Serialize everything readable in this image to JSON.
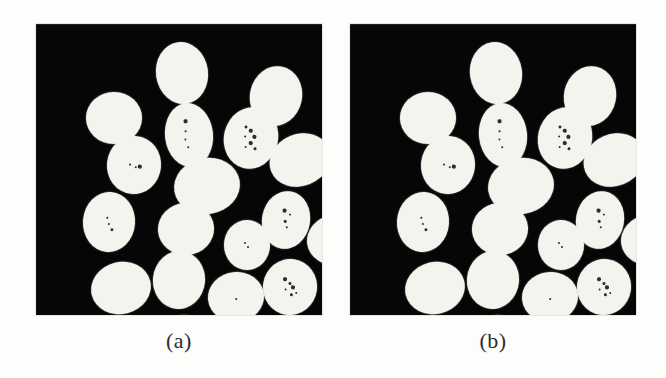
{
  "figure": {
    "width": 666,
    "height": 378,
    "background_color": "#fdfdfc",
    "panel_background_color": "#060606",
    "object_color": "#f4f4ef",
    "speck_color": "#1b1b18",
    "caption_color": "#2c2c2c"
  },
  "panels": [
    {
      "id": "panel-a",
      "caption": "(a)",
      "frame": {
        "x": 36,
        "y": 24,
        "width": 286,
        "height": 291
      },
      "caption_y": 330,
      "object_count": 17,
      "objects": [
        {
          "cx": 146,
          "cy": 49,
          "rx": 26,
          "ry": 31,
          "rot": -8,
          "specks": []
        },
        {
          "cx": 240,
          "cy": 72,
          "rx": 26,
          "ry": 30,
          "rot": 12,
          "specks": []
        },
        {
          "cx": 78,
          "cy": 94,
          "rx": 28,
          "ry": 26,
          "rot": 0,
          "specks": []
        },
        {
          "cx": 153,
          "cy": 111,
          "rx": 24,
          "ry": 32,
          "rot": -6,
          "specks": [
            {
              "x": -2,
              "y": -14,
              "r": 1.6
            },
            {
              "x": -3,
              "y": -4,
              "r": 1.0
            },
            {
              "x": -4,
              "y": 4,
              "r": 1.0
            },
            {
              "x": -2,
              "y": 12,
              "r": 1.3
            }
          ]
        },
        {
          "cx": 215,
          "cy": 114,
          "rx": 27,
          "ry": 31,
          "rot": 14,
          "specks": [
            {
              "x": -8,
              "y": -10,
              "r": 1.5
            },
            {
              "x": -2,
              "y": -7,
              "r": 1.8
            },
            {
              "x": 3,
              "y": -2,
              "r": 1.6
            },
            {
              "x": -6,
              "y": 0,
              "r": 1.4
            },
            {
              "x": 1,
              "y": 5,
              "r": 1.7
            },
            {
              "x": 6,
              "y": 9,
              "r": 1.5
            },
            {
              "x": -3,
              "y": 10,
              "r": 1.2
            }
          ]
        },
        {
          "cx": 264,
          "cy": 136,
          "rx": 31,
          "ry": 26,
          "rot": -22,
          "specks": []
        },
        {
          "cx": 98,
          "cy": 141,
          "rx": 27,
          "ry": 29,
          "rot": 6,
          "specks": [
            {
              "x": -4,
              "y": 0,
              "r": 1.4
            },
            {
              "x": 2,
              "y": 2,
              "r": 1.2
            },
            {
              "x": 6,
              "y": 1,
              "r": 1.6
            }
          ]
        },
        {
          "cx": 171,
          "cy": 162,
          "rx": 33,
          "ry": 28,
          "rot": -10,
          "specks": []
        },
        {
          "cx": 73,
          "cy": 198,
          "rx": 26,
          "ry": 30,
          "rot": 4,
          "specks": [
            {
              "x": -2,
              "y": -4,
              "r": 1.4
            },
            {
              "x": 0,
              "y": 2,
              "r": 1.3
            },
            {
              "x": 3,
              "y": 7,
              "r": 1.5
            }
          ]
        },
        {
          "cx": 150,
          "cy": 205,
          "rx": 28,
          "ry": 26,
          "rot": -4,
          "specks": []
        },
        {
          "cx": 211,
          "cy": 221,
          "rx": 23,
          "ry": 25,
          "rot": 0,
          "specks": [
            {
              "x": -2,
              "y": -2,
              "r": 1.1
            },
            {
              "x": 1,
              "y": 2,
              "r": 1.0
            }
          ]
        },
        {
          "cx": 250,
          "cy": 196,
          "rx": 24,
          "ry": 29,
          "rot": 10,
          "specks": [
            {
              "x": -3,
              "y": -9,
              "r": 1.6
            },
            {
              "x": 3,
              "y": -6,
              "r": 1.4
            },
            {
              "x": -1,
              "y": 1,
              "r": 1.5
            },
            {
              "x": 2,
              "y": 7,
              "r": 1.3
            }
          ]
        },
        {
          "cx": 299,
          "cy": 216,
          "rx": 28,
          "ry": 25,
          "rot": -8,
          "specks": [
            {
              "x": -1,
              "y": -4,
              "r": 1.3
            },
            {
              "x": 4,
              "y": 1,
              "r": 1.2
            },
            {
              "x": -3,
              "y": 5,
              "r": 1.1
            }
          ]
        },
        {
          "cx": 85,
          "cy": 264,
          "rx": 30,
          "ry": 26,
          "rot": -14,
          "specks": []
        },
        {
          "cx": 143,
          "cy": 256,
          "rx": 26,
          "ry": 29,
          "rot": 6,
          "specks": []
        },
        {
          "cx": 200,
          "cy": 273,
          "rx": 28,
          "ry": 25,
          "rot": -6,
          "specks": [
            {
              "x": 0,
              "y": 2,
              "r": 1.1
            }
          ]
        },
        {
          "cx": 254,
          "cy": 263,
          "rx": 27,
          "ry": 28,
          "rot": 8,
          "specks": [
            {
              "x": -6,
              "y": -7,
              "r": 1.7
            },
            {
              "x": -1,
              "y": -4,
              "r": 1.5
            },
            {
              "x": 3,
              "y": 0,
              "r": 1.6
            },
            {
              "x": -4,
              "y": 3,
              "r": 1.4
            },
            {
              "x": 2,
              "y": 7,
              "r": 1.5
            },
            {
              "x": 7,
              "y": 5,
              "r": 1.3
            }
          ]
        },
        {
          "cx": 148,
          "cy": 315,
          "rx": 26,
          "ry": 24,
          "rot": 0,
          "specks": []
        }
      ]
    },
    {
      "id": "panel-b",
      "caption": "(b)",
      "frame": {
        "x": 350,
        "y": 24,
        "width": 286,
        "height": 291
      },
      "caption_y": 330,
      "object_count": 17,
      "objects": [
        {
          "cx": 146,
          "cy": 49,
          "rx": 26,
          "ry": 31,
          "rot": -8,
          "specks": []
        },
        {
          "cx": 240,
          "cy": 72,
          "rx": 26,
          "ry": 30,
          "rot": 12,
          "specks": []
        },
        {
          "cx": 78,
          "cy": 94,
          "rx": 28,
          "ry": 26,
          "rot": 0,
          "specks": []
        },
        {
          "cx": 153,
          "cy": 111,
          "rx": 24,
          "ry": 32,
          "rot": -6,
          "specks": [
            {
              "x": -2,
              "y": -14,
              "r": 1.6
            },
            {
              "x": -3,
              "y": -4,
              "r": 1.0
            },
            {
              "x": -4,
              "y": 4,
              "r": 1.0
            },
            {
              "x": -2,
              "y": 12,
              "r": 1.3
            }
          ]
        },
        {
          "cx": 215,
          "cy": 114,
          "rx": 27,
          "ry": 31,
          "rot": 14,
          "specks": [
            {
              "x": -8,
              "y": -10,
              "r": 1.5
            },
            {
              "x": -2,
              "y": -7,
              "r": 1.8
            },
            {
              "x": 3,
              "y": -2,
              "r": 1.6
            },
            {
              "x": -6,
              "y": 0,
              "r": 1.4
            },
            {
              "x": 1,
              "y": 5,
              "r": 1.7
            },
            {
              "x": 6,
              "y": 9,
              "r": 1.5
            },
            {
              "x": -3,
              "y": 10,
              "r": 1.2
            }
          ]
        },
        {
          "cx": 264,
          "cy": 136,
          "rx": 31,
          "ry": 26,
          "rot": -22,
          "specks": []
        },
        {
          "cx": 98,
          "cy": 141,
          "rx": 27,
          "ry": 29,
          "rot": 6,
          "specks": [
            {
              "x": -4,
              "y": 0,
              "r": 1.4
            },
            {
              "x": 2,
              "y": 2,
              "r": 1.2
            },
            {
              "x": 6,
              "y": 1,
              "r": 1.6
            }
          ]
        },
        {
          "cx": 171,
          "cy": 162,
          "rx": 33,
          "ry": 28,
          "rot": -10,
          "specks": []
        },
        {
          "cx": 73,
          "cy": 198,
          "rx": 26,
          "ry": 30,
          "rot": 4,
          "specks": [
            {
              "x": -2,
              "y": -4,
              "r": 1.4
            },
            {
              "x": 0,
              "y": 2,
              "r": 1.3
            },
            {
              "x": 3,
              "y": 7,
              "r": 1.5
            }
          ]
        },
        {
          "cx": 150,
          "cy": 205,
          "rx": 28,
          "ry": 26,
          "rot": -4,
          "specks": []
        },
        {
          "cx": 211,
          "cy": 221,
          "rx": 23,
          "ry": 25,
          "rot": 0,
          "specks": [
            {
              "x": -2,
              "y": -2,
              "r": 1.1
            },
            {
              "x": 1,
              "y": 2,
              "r": 1.0
            }
          ]
        },
        {
          "cx": 250,
          "cy": 196,
          "rx": 24,
          "ry": 29,
          "rot": 10,
          "specks": [
            {
              "x": -3,
              "y": -9,
              "r": 1.6
            },
            {
              "x": 3,
              "y": -6,
              "r": 1.4
            },
            {
              "x": -1,
              "y": 1,
              "r": 1.5
            },
            {
              "x": 2,
              "y": 7,
              "r": 1.3
            }
          ]
        },
        {
          "cx": 299,
          "cy": 216,
          "rx": 28,
          "ry": 25,
          "rot": -8,
          "specks": [
            {
              "x": -1,
              "y": -4,
              "r": 1.3
            },
            {
              "x": 4,
              "y": 1,
              "r": 1.2
            },
            {
              "x": -3,
              "y": 5,
              "r": 1.1
            }
          ]
        },
        {
          "cx": 85,
          "cy": 264,
          "rx": 30,
          "ry": 26,
          "rot": -14,
          "specks": []
        },
        {
          "cx": 143,
          "cy": 256,
          "rx": 26,
          "ry": 29,
          "rot": 6,
          "specks": []
        },
        {
          "cx": 200,
          "cy": 273,
          "rx": 28,
          "ry": 25,
          "rot": -6,
          "specks": [
            {
              "x": 0,
              "y": 2,
              "r": 1.1
            }
          ]
        },
        {
          "cx": 254,
          "cy": 263,
          "rx": 27,
          "ry": 28,
          "rot": 8,
          "specks": [
            {
              "x": -6,
              "y": -7,
              "r": 1.7
            },
            {
              "x": -1,
              "y": -4,
              "r": 1.5
            },
            {
              "x": 3,
              "y": 0,
              "r": 1.6
            },
            {
              "x": -4,
              "y": 3,
              "r": 1.4
            },
            {
              "x": 2,
              "y": 7,
              "r": 1.5
            },
            {
              "x": 7,
              "y": 5,
              "r": 1.3
            }
          ]
        },
        {
          "cx": 148,
          "cy": 315,
          "rx": 26,
          "ry": 24,
          "rot": 0,
          "specks": []
        }
      ]
    }
  ]
}
